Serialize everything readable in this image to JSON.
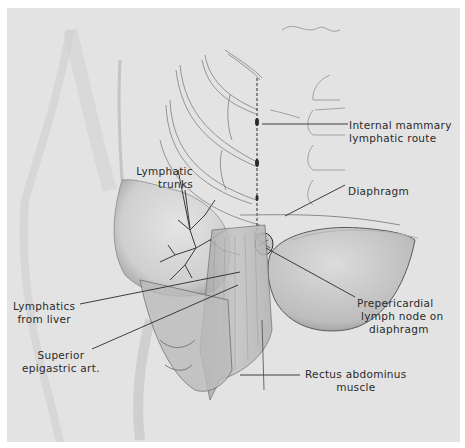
{
  "figure": {
    "background": "#e3e3e3",
    "ink": "#2a2a2a"
  },
  "labels": {
    "internal_mammary": {
      "line1": "Internal mammary",
      "line2": "lymphatic route"
    },
    "lymphatic_trunks": {
      "line1": "Lymphatic",
      "line2": "trunks"
    },
    "diaphragm": {
      "line1": "Diaphragm"
    },
    "lymphatics_liver": {
      "line1": "Lymphatics",
      "line2": "from liver"
    },
    "prepericardial": {
      "line1": "Prepericardial",
      "line2": "lymph node on",
      "line3": "diaphragm"
    },
    "superior_epigastric": {
      "line1": "Superior",
      "line2": "epigastric art."
    },
    "rectus": {
      "line1": "Rectus abdominus",
      "line2": "muscle"
    }
  }
}
